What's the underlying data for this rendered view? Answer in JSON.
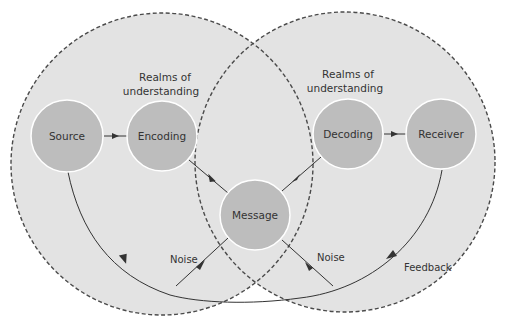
{
  "colors": {
    "realm_fill": "#e3e3e3",
    "realm_stroke": "#4a4a4a",
    "node_fill": "#bdbdbd",
    "node_stroke": "#ffffff",
    "line": "#333333",
    "text": "#333333"
  },
  "realms": [
    {
      "id": "sender-realm",
      "label_line1": "Realms of",
      "label_line2": "understanding"
    },
    {
      "id": "receiver-realm",
      "label_line1": "Realms of",
      "label_line2": "understanding"
    }
  ],
  "nodes": [
    {
      "id": "source",
      "label": "Source"
    },
    {
      "id": "encoding",
      "label": "Encoding"
    },
    {
      "id": "message",
      "label": "Message"
    },
    {
      "id": "decoding",
      "label": "Decoding"
    },
    {
      "id": "receiver",
      "label": "Receiver"
    }
  ],
  "edges": [
    {
      "from": "source",
      "to": "encoding"
    },
    {
      "from": "encoding",
      "to": "message"
    },
    {
      "from": "message",
      "to": "decoding"
    },
    {
      "from": "decoding",
      "to": "receiver"
    },
    {
      "from": "receiver",
      "to": "source",
      "label": "Feedback"
    },
    {
      "from": "noise-left",
      "to": "message",
      "label": "Noise"
    },
    {
      "from": "noise-right",
      "to": "message",
      "label": "Noise"
    }
  ],
  "labels": {
    "noise_left": "Noise",
    "noise_right": "Noise",
    "feedback": "Feedback"
  }
}
